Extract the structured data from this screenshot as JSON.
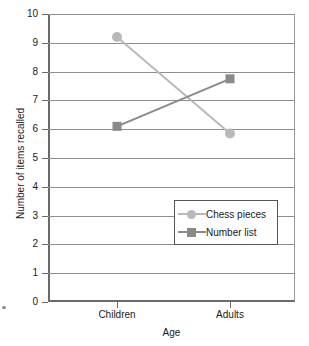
{
  "chart_data": {
    "type": "line",
    "title": "",
    "xlabel": "Age",
    "ylabel": "Number of items recalled",
    "categories": [
      "Children",
      "Adults"
    ],
    "ylim": [
      0,
      10
    ],
    "ytick_values": [
      0,
      1,
      2,
      3,
      4,
      5,
      6,
      7,
      8,
      9,
      10
    ],
    "ytick_labels": [
      "0",
      "1",
      "2",
      "3",
      "4",
      "5",
      "6",
      "7",
      "8",
      "9",
      "10"
    ],
    "grid": true,
    "legend_position": "inside-center-right",
    "series": [
      {
        "name": "Chess pieces",
        "marker": "circle",
        "color": "#b9b9b9",
        "values": [
          9.2,
          5.85
        ]
      },
      {
        "name": "Number list",
        "marker": "square",
        "color": "#8a8a8a",
        "values": [
          6.1,
          7.75
        ]
      }
    ]
  },
  "axes": {
    "x_title": "Age",
    "y_title": "Number of items recalled",
    "x_categories": [
      "Children",
      "Adults"
    ],
    "y_labels": [
      "10",
      "9",
      "8",
      "7",
      "6",
      "5",
      "4",
      "3",
      "2",
      "1",
      "0"
    ]
  },
  "legend": {
    "entries": [
      {
        "label": "Chess pieces",
        "marker": "circle-marker",
        "color": "#b9b9b9"
      },
      {
        "label": "Number list",
        "marker": "square-marker",
        "color": "#8a8a8a"
      }
    ]
  },
  "colors": {
    "chess_pieces": "#b9b9b9",
    "number_list": "#8a8a8a",
    "axis": "#6a6a6a",
    "gridline": "#8e8e8e",
    "text": "#1a1a1a",
    "background": "#ffffff"
  }
}
